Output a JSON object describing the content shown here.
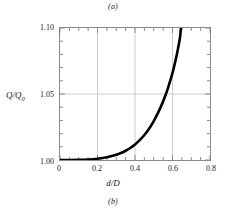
{
  "figure": {
    "caption_top": "(a)",
    "caption_bottom": "(b)"
  },
  "chart_data": {
    "type": "line",
    "title": "",
    "xlabel": "d/D",
    "ylabel": "Q/Q0",
    "ylabel_base": "Q/Q",
    "ylabel_sub": "0",
    "xlim": [
      0,
      0.8
    ],
    "ylim": [
      1.0,
      1.1
    ],
    "xticks": [
      0,
      0.2,
      0.4,
      0.6,
      0.8
    ],
    "xtick_labels": [
      "0",
      "0.2",
      "0.4",
      "0.6",
      "0.8"
    ],
    "yticks": [
      1.0,
      1.05,
      1.1
    ],
    "ytick_labels": [
      "1.00",
      "1.05",
      "1.10"
    ],
    "y_minor_tick_step": 0.01,
    "x_minor_tick_step": 0.05,
    "grid": true,
    "grid_x_values": [
      0.2,
      0.4,
      0.6
    ],
    "grid_y_values": [
      1.05
    ],
    "grid_color": "#cccccc",
    "frame_color": "#8a8a8a",
    "line_color": "#000000",
    "line_width_px": 2.6,
    "legend": null,
    "series": [
      {
        "name": "Q/Q0 vs d/D",
        "x": [
          0.0,
          0.05,
          0.1,
          0.15,
          0.2,
          0.25,
          0.3,
          0.325,
          0.35,
          0.375,
          0.4,
          0.425,
          0.45,
          0.475,
          0.5,
          0.52,
          0.54,
          0.56,
          0.575,
          0.59,
          0.6,
          0.61,
          0.62,
          0.63,
          0.64,
          0.645
        ],
        "y": [
          1.0,
          1.0,
          1.0001,
          1.0004,
          1.001,
          1.0021,
          1.004,
          1.0053,
          1.007,
          1.0091,
          1.0118,
          1.015,
          1.0189,
          1.0237,
          1.0295,
          1.0349,
          1.041,
          1.0481,
          1.0541,
          1.061,
          1.066,
          1.0716,
          1.0778,
          1.0848,
          1.0928,
          1.1
        ]
      }
    ]
  }
}
